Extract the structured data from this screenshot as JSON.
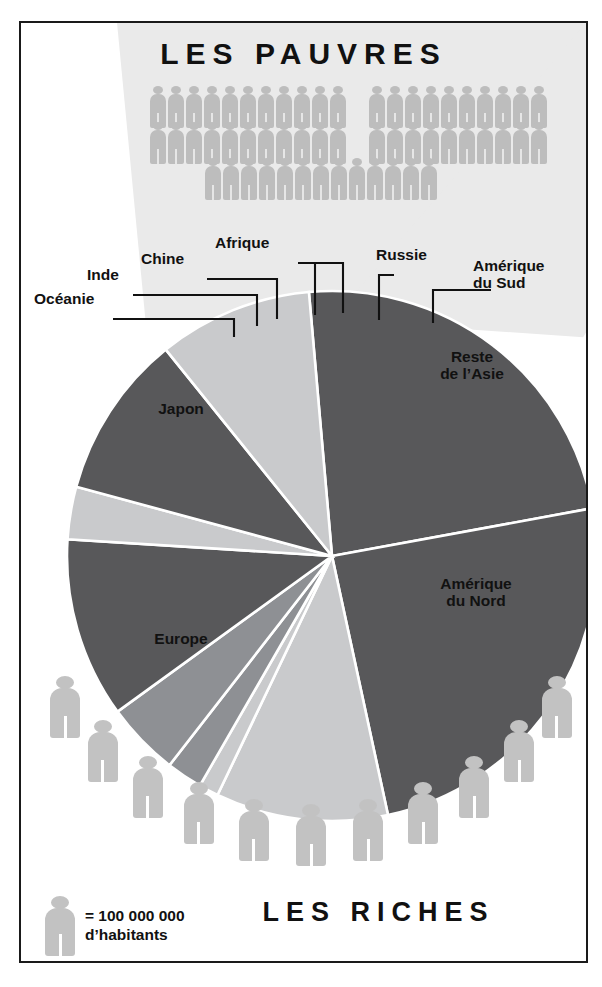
{
  "figure": {
    "title_top": "LES PAUVRES",
    "title_bottom": "LES RICHES",
    "legend_symbol": "person-icon",
    "legend_line1": "= 100 000 000",
    "legend_line2": "d’habitants",
    "caption_fragment": ""
  },
  "colors": {
    "dark": "#58585a",
    "mid": "#8e9094",
    "light": "#c9cacc",
    "panel": "#eaeaea",
    "person": "#c2c2c2",
    "person_small": "#bdbdbd",
    "ink": "#111111"
  },
  "crowd": {
    "row1_left_count": 11,
    "row1_right_count": 10,
    "row2_left_count": 11,
    "row2_right_count": 10,
    "row3_count": 13
  },
  "arc_people_count": 11,
  "chart_data": {
    "type": "pie",
    "unit": "part de la population mondiale (%)",
    "legend_position": "callouts",
    "labels": [
      "Amérique du Nord",
      "Europe",
      "Japon",
      "Océanie",
      "Inde",
      "Chine",
      "Afrique",
      "Russie",
      "Amérique du Sud",
      "Reste de l’Asie"
    ],
    "values": [
      23.5,
      24.5,
      10.5,
      1.2,
      2.2,
      4.5,
      11.0,
      3.2,
      10.0,
      9.4
    ],
    "slice_shades": [
      "dark",
      "dark",
      "light",
      "light",
      "mid",
      "mid",
      "dark",
      "light",
      "dark",
      "light"
    ],
    "start_angle_deg": -95,
    "direction": "clockwise",
    "inner_labels": [
      {
        "key": "japon",
        "text": "Japon"
      },
      {
        "key": "europe",
        "text": "Europe"
      },
      {
        "key": "nord",
        "text": "Amérique\ndu Nord"
      },
      {
        "key": "asie",
        "text": "Reste\nde l’Asie"
      }
    ],
    "callout_labels": [
      {
        "key": "oceanie",
        "text": "Océanie"
      },
      {
        "key": "inde",
        "text": "Inde"
      },
      {
        "key": "chine",
        "text": "Chine"
      },
      {
        "key": "afrique",
        "text": "Afrique"
      },
      {
        "key": "russie",
        "text": "Russie"
      },
      {
        "key": "amsud",
        "text": "Amérique\ndu Sud"
      }
    ]
  },
  "pie_labels": {
    "japon": "Japon",
    "europe": "Europe",
    "amerique_nord_l1": "Amérique",
    "amerique_nord_l2": "du Nord",
    "reste_asie_l1": "Reste",
    "reste_asie_l2": "de l’Asie",
    "oceanie": "Océanie",
    "inde": "Inde",
    "chine": "Chine",
    "afrique": "Afrique",
    "russie": "Russie",
    "amerique_sud_l1": "Amérique",
    "amerique_sud_l2": "du Sud"
  }
}
